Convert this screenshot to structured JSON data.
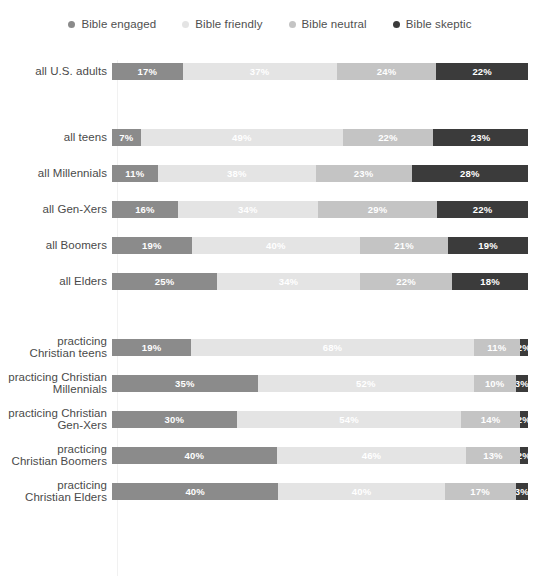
{
  "legend": {
    "position": "top-center",
    "items": [
      {
        "label": "Bible engaged",
        "color": "#8b8b8b",
        "icon": "legend-dot-icon"
      },
      {
        "label": "Bible friendly",
        "color": "#e4e4e4",
        "icon": "legend-dot-icon"
      },
      {
        "label": "Bible neutral",
        "color": "#c4c4c4",
        "icon": "legend-dot-icon"
      },
      {
        "label": "Bible skeptic",
        "color": "#3b3b3b",
        "icon": "legend-dot-icon"
      }
    ]
  },
  "chart_data": {
    "type": "bar",
    "orientation": "horizontal",
    "stacked": true,
    "stack_mode": "percent",
    "title": "",
    "xlabel": "",
    "ylabel": "",
    "xlim": [
      0,
      100
    ],
    "grid": false,
    "legend_position": "top-center",
    "value_format": "{v}%",
    "series": [
      {
        "name": "Bible engaged",
        "color": "#8b8b8b",
        "values": [
          17,
          7,
          11,
          16,
          19,
          25,
          19,
          35,
          30,
          40,
          40
        ]
      },
      {
        "name": "Bible friendly",
        "color": "#e4e4e4",
        "values": [
          37,
          49,
          38,
          34,
          40,
          34,
          68,
          52,
          54,
          46,
          40
        ]
      },
      {
        "name": "Bible neutral",
        "color": "#c4c4c4",
        "values": [
          24,
          22,
          23,
          29,
          21,
          22,
          11,
          10,
          14,
          13,
          17
        ]
      },
      {
        "name": "Bible skeptic",
        "color": "#3b3b3b",
        "values": [
          22,
          23,
          28,
          22,
          19,
          18,
          2,
          3,
          2,
          2,
          3
        ]
      }
    ],
    "categories": [
      "all U.S. adults",
      "all teens",
      "all Millennials",
      "all Gen-Xers",
      "all Boomers",
      "all Elders",
      "practicing Christian teens",
      "practicing Christian Millennials",
      "practicing Christian Gen-Xers",
      "practicing Christian Boomers",
      "practicing Christian Elders"
    ]
  },
  "rows": [
    {
      "label_lines": [
        "all U.S. adults"
      ],
      "spacing": "none",
      "segments": [
        {
          "value": 17,
          "text": "17%",
          "series": "Bible engaged"
        },
        {
          "value": 37,
          "text": "37%",
          "series": "Bible friendly"
        },
        {
          "value": 24,
          "text": "24%",
          "series": "Bible neutral"
        },
        {
          "value": 22,
          "text": "22%",
          "series": "Bible skeptic"
        }
      ]
    },
    {
      "label_lines": [
        "all teens"
      ],
      "spacing": "xl",
      "segments": [
        {
          "value": 7,
          "text": "7%",
          "series": "Bible engaged"
        },
        {
          "value": 49,
          "text": "49%",
          "series": "Bible friendly"
        },
        {
          "value": 22,
          "text": "22%",
          "series": "Bible neutral"
        },
        {
          "value": 23,
          "text": "23%",
          "series": "Bible skeptic"
        }
      ]
    },
    {
      "label_lines": [
        "all Millennials"
      ],
      "spacing": "sm",
      "segments": [
        {
          "value": 11,
          "text": "11%",
          "series": "Bible engaged"
        },
        {
          "value": 38,
          "text": "38%",
          "series": "Bible friendly"
        },
        {
          "value": 23,
          "text": "23%",
          "series": "Bible neutral"
        },
        {
          "value": 28,
          "text": "28%",
          "series": "Bible skeptic"
        }
      ]
    },
    {
      "label_lines": [
        "all Gen-Xers"
      ],
      "spacing": "sm",
      "segments": [
        {
          "value": 16,
          "text": "16%",
          "series": "Bible engaged"
        },
        {
          "value": 34,
          "text": "34%",
          "series": "Bible friendly"
        },
        {
          "value": 29,
          "text": "29%",
          "series": "Bible neutral"
        },
        {
          "value": 22,
          "text": "22%",
          "series": "Bible skeptic"
        }
      ]
    },
    {
      "label_lines": [
        "all Boomers"
      ],
      "spacing": "sm",
      "segments": [
        {
          "value": 19,
          "text": "19%",
          "series": "Bible engaged"
        },
        {
          "value": 40,
          "text": "40%",
          "series": "Bible friendly"
        },
        {
          "value": 21,
          "text": "21%",
          "series": "Bible neutral"
        },
        {
          "value": 19,
          "text": "19%",
          "series": "Bible skeptic"
        }
      ]
    },
    {
      "label_lines": [
        "all Elders"
      ],
      "spacing": "sm",
      "segments": [
        {
          "value": 25,
          "text": "25%",
          "series": "Bible engaged"
        },
        {
          "value": 34,
          "text": "34%",
          "series": "Bible friendly"
        },
        {
          "value": 22,
          "text": "22%",
          "series": "Bible neutral"
        },
        {
          "value": 18,
          "text": "18%",
          "series": "Bible skeptic"
        }
      ]
    },
    {
      "label_lines": [
        "practicing",
        "Christian teens"
      ],
      "spacing": "xl",
      "segments": [
        {
          "value": 19,
          "text": "19%",
          "series": "Bible engaged"
        },
        {
          "value": 68,
          "text": "68%",
          "series": "Bible friendly"
        },
        {
          "value": 11,
          "text": "11%",
          "series": "Bible neutral"
        },
        {
          "value": 2,
          "text": "2%",
          "series": "Bible skeptic"
        }
      ]
    },
    {
      "label_lines": [
        "practicing Christian",
        "Millennials"
      ],
      "spacing": "sm",
      "segments": [
        {
          "value": 35,
          "text": "35%",
          "series": "Bible engaged"
        },
        {
          "value": 52,
          "text": "52%",
          "series": "Bible friendly"
        },
        {
          "value": 10,
          "text": "10%",
          "series": "Bible neutral"
        },
        {
          "value": 3,
          "text": "3%",
          "series": "Bible skeptic"
        }
      ]
    },
    {
      "label_lines": [
        "practicing Christian",
        "Gen-Xers"
      ],
      "spacing": "sm",
      "segments": [
        {
          "value": 30,
          "text": "30%",
          "series": "Bible engaged"
        },
        {
          "value": 54,
          "text": "54%",
          "series": "Bible friendly"
        },
        {
          "value": 14,
          "text": "14%",
          "series": "Bible neutral"
        },
        {
          "value": 2,
          "text": "2%",
          "series": "Bible skeptic"
        }
      ]
    },
    {
      "label_lines": [
        "practicing",
        "Christian Boomers"
      ],
      "spacing": "sm",
      "segments": [
        {
          "value": 40,
          "text": "40%",
          "series": "Bible engaged"
        },
        {
          "value": 46,
          "text": "46%",
          "series": "Bible friendly"
        },
        {
          "value": 13,
          "text": "13%",
          "series": "Bible neutral"
        },
        {
          "value": 2,
          "text": "2%",
          "series": "Bible skeptic"
        }
      ]
    },
    {
      "label_lines": [
        "practicing",
        "Christian Elders"
      ],
      "spacing": "sm",
      "segments": [
        {
          "value": 40,
          "text": "40%",
          "series": "Bible engaged"
        },
        {
          "value": 40,
          "text": "40%",
          "series": "Bible friendly"
        },
        {
          "value": 17,
          "text": "17%",
          "series": "Bible neutral"
        },
        {
          "value": 3,
          "text": "3%",
          "series": "Bible skeptic"
        }
      ]
    }
  ]
}
